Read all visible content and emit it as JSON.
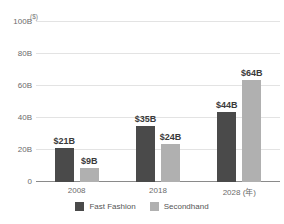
{
  "title_fragment": "",
  "colors": {
    "fast_fashion": "#4a4a4a",
    "secondhand": "#b0b0b0",
    "grid": "#e3e3e3",
    "axis": "#8a8a8a",
    "text": "#6b6b6b"
  },
  "axis": {
    "unit_label": "($)",
    "y_ticks": [
      "100B",
      "80B",
      "60B",
      "40B",
      "20B",
      "0"
    ],
    "x_labels": [
      "2008",
      "2018",
      "2028 (年)"
    ]
  },
  "legend": {
    "items": [
      {
        "label": "Fast Fashion",
        "color": "#4a4a4a"
      },
      {
        "label": "Secondhand",
        "color": "#b0b0b0"
      }
    ]
  },
  "chart_data": {
    "type": "bar",
    "title": "",
    "xlabel": "",
    "ylabel": "($)",
    "ylim": [
      0,
      100
    ],
    "ytick_values": [
      0,
      20,
      40,
      60,
      80,
      100
    ],
    "ytick_labels": [
      "0",
      "20B",
      "40B",
      "60B",
      "80B",
      "100B"
    ],
    "grid": true,
    "legend_position": "bottom-center",
    "categories": [
      "2008",
      "2018",
      "2028 (年)"
    ],
    "series": [
      {
        "name": "Fast Fashion",
        "color": "#4a4a4a",
        "values": [
          21,
          35,
          44
        ],
        "data_labels": [
          "$21B",
          "$35B",
          "$44B"
        ]
      },
      {
        "name": "Secondhand",
        "color": "#b0b0b0",
        "values": [
          9,
          24,
          64
        ],
        "data_labels": [
          "$9B",
          "$24B",
          "$64B"
        ]
      }
    ]
  }
}
